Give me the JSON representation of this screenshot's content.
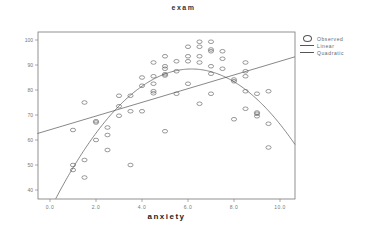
{
  "chart_data": {
    "type": "scatter",
    "title": "exam",
    "xlabel": "anxiety",
    "ylabel": "",
    "xlim": [
      -0.55,
      10.65
    ],
    "ylim": [
      36.4,
      102.8
    ],
    "xticks": [
      0.0,
      2.0,
      4.0,
      6.0,
      8.0,
      10.0
    ],
    "xtick_labels": [
      "0.0",
      "2.0",
      "4.0",
      "6.0",
      "8.0",
      "10.0"
    ],
    "yticks": [
      40,
      50,
      60,
      70,
      80,
      90,
      100
    ],
    "ytick_labels": [
      "40",
      "50",
      "60",
      "70",
      "80",
      "90",
      "100"
    ],
    "grid": false,
    "legend_position": "right",
    "legend": [
      "Observed",
      "Linear",
      "Quadratic"
    ],
    "series": [
      {
        "name": "Observed",
        "kind": "scatter",
        "marker": "open-circle",
        "points": [
          [
            1.0,
            64
          ],
          [
            1.0,
            50
          ],
          [
            1.0,
            48
          ],
          [
            1.5,
            75
          ],
          [
            1.5,
            52
          ],
          [
            1.5,
            45
          ],
          [
            2.0,
            67.5
          ],
          [
            2.0,
            67
          ],
          [
            2.0,
            60
          ],
          [
            2.5,
            65
          ],
          [
            2.5,
            62
          ],
          [
            2.5,
            56
          ],
          [
            3.0,
            77.7
          ],
          [
            3.0,
            73.5
          ],
          [
            3.0,
            69.7
          ],
          [
            3.5,
            77.7
          ],
          [
            3.5,
            71.5
          ],
          [
            3.5,
            50
          ],
          [
            4.0,
            85
          ],
          [
            4.0,
            81.7
          ],
          [
            4.0,
            71.5
          ],
          [
            4.5,
            91
          ],
          [
            4.5,
            85.5
          ],
          [
            4.5,
            82.5
          ],
          [
            4.5,
            79.5
          ],
          [
            4.5,
            78.7
          ],
          [
            5.0,
            93.5
          ],
          [
            5.0,
            89.5
          ],
          [
            5.0,
            88.5
          ],
          [
            5.0,
            86.3
          ],
          [
            5.0,
            85.8
          ],
          [
            5.0,
            63.5
          ],
          [
            5.5,
            91.5
          ],
          [
            5.5,
            87.5
          ],
          [
            5.5,
            78.5
          ],
          [
            6.0,
            97.3
          ],
          [
            6.0,
            93.5
          ],
          [
            6.0,
            91.5
          ],
          [
            6.0,
            82.5
          ],
          [
            6.5,
            99.3
          ],
          [
            6.5,
            97.3
          ],
          [
            6.5,
            93.5
          ],
          [
            6.5,
            91
          ],
          [
            6.5,
            74.5
          ],
          [
            7.0,
            99.3
          ],
          [
            7.0,
            96.2
          ],
          [
            7.0,
            95.5
          ],
          [
            7.0,
            89.5
          ],
          [
            7.0,
            86.5
          ],
          [
            7.0,
            78.5
          ],
          [
            7.5,
            95.5
          ],
          [
            7.5,
            92.5
          ],
          [
            7.5,
            88.5
          ],
          [
            8.0,
            84.2
          ],
          [
            8.0,
            83.5
          ],
          [
            8.0,
            68.3
          ],
          [
            8.5,
            91
          ],
          [
            8.5,
            87.5
          ],
          [
            8.5,
            85.5
          ],
          [
            8.5,
            79.5
          ],
          [
            8.5,
            72.5
          ],
          [
            9.0,
            78.5
          ],
          [
            9.0,
            71
          ],
          [
            9.0,
            70.5
          ],
          [
            9.0,
            69.5
          ],
          [
            9.5,
            79.5
          ],
          [
            9.5,
            66.5
          ],
          [
            9.5,
            57
          ]
        ]
      },
      {
        "name": "Linear",
        "kind": "line",
        "intercept": 64.1,
        "slope": 2.74
      },
      {
        "name": "Quadratic",
        "kind": "curve",
        "vertex_x": 6.15,
        "vertex_y": 88.4,
        "k": 1.49
      }
    ]
  }
}
